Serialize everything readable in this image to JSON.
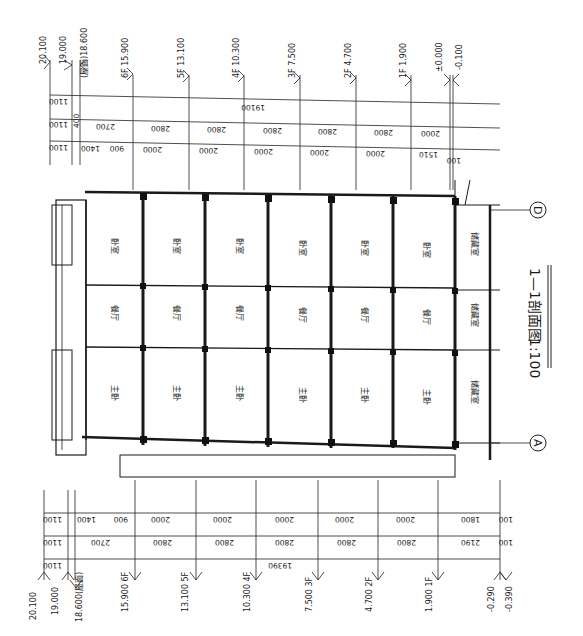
{
  "drawing": {
    "title": "1—1剖面图",
    "scale": "1:100",
    "orientation": "rotated 90° clockwise"
  },
  "axes": [
    {
      "label": "A"
    },
    {
      "label": "D"
    }
  ],
  "right_elevations": [
    {
      "label": "20.100"
    },
    {
      "label": "19.000"
    },
    {
      "label": "(屋面)18.600"
    },
    {
      "label": "6F 15.900"
    },
    {
      "label": "5F 13.100"
    },
    {
      "label": "4F 10.300"
    },
    {
      "label": "3F 7.500"
    },
    {
      "label": "2F 4.700"
    },
    {
      "label": "1F 1.900"
    },
    {
      "label": "±0.000"
    },
    {
      "label": "-0.100"
    }
  ],
  "left_elevations": [
    {
      "label": "20.100"
    },
    {
      "label": "19.000"
    },
    {
      "label": "18.600(屋面)"
    },
    {
      "label": "15.900 6F"
    },
    {
      "label": "13.100 5F"
    },
    {
      "label": "10.300 4F"
    },
    {
      "label": "7.500 3F"
    },
    {
      "label": "4.700 2F"
    },
    {
      "label": "1.900 1F"
    },
    {
      "label": "-0.290"
    },
    {
      "label": "-0.390"
    }
  ],
  "right_dims": {
    "overall": [
      "1100",
      "19100"
    ],
    "floors": [
      "1100",
      "400",
      "2700",
      "2800",
      "2800",
      "2800",
      "2800",
      "2800",
      "2000"
    ],
    "detail": [
      "1100",
      "400",
      "400",
      "1400",
      "900",
      "500",
      "2000",
      "300",
      "500",
      "2000",
      "300",
      "500",
      "2000",
      "300",
      "500",
      "2000",
      "300",
      "500",
      "2000",
      "300",
      "390",
      "1510",
      "100"
    ]
  },
  "left_dims": {
    "overall": [
      "1100",
      "19390"
    ],
    "floors": [
      "1100",
      "400",
      "2700",
      "2800",
      "2800",
      "2800",
      "2800",
      "2800",
      "2190",
      "100"
    ],
    "detail": [
      "1100",
      "400",
      "400",
      "1400",
      "900",
      "500",
      "2000",
      "300",
      "500",
      "2000",
      "300",
      "500",
      "2000",
      "300",
      "500",
      "2000",
      "300",
      "500",
      "2000",
      "300",
      "390",
      "1800",
      "100"
    ]
  },
  "rooms": {
    "columns": [
      "卧室",
      "餐厅",
      "主卧"
    ],
    "ground_floor": [
      "储藏室",
      "储藏室",
      "储藏室"
    ],
    "upper_floors": 6
  }
}
